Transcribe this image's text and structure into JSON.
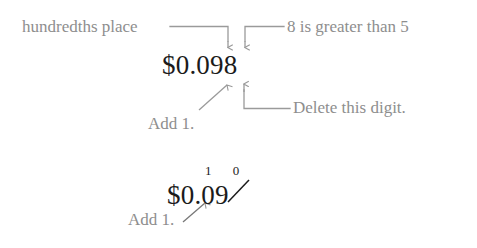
{
  "figure": {
    "background_color": "#ffffff",
    "label_color": "#8e8e8e",
    "number_color": "#1b1b1b",
    "line_color": "#9a9a9a"
  },
  "step_one": {
    "amount": "$0.098",
    "labels": {
      "hundredths_place": "hundredths place",
      "greater_than": "8 is greater than 5",
      "delete_digit": "Delete this digit.",
      "add_one": "Add 1."
    },
    "annotations": {
      "arrow_to_hundredths": "down-arrow-icon",
      "arrow_to_thousandths": "down-arrow-icon",
      "arrow_add_one": "up-right-arrow-icon",
      "arrow_delete": "up-arrow-icon"
    }
  },
  "step_two": {
    "amount_prefix": "$0.0",
    "struck_digit": "9",
    "carry_digits": "1 0",
    "carry_digit_left": "1",
    "carry_digit_right": "0",
    "labels": {
      "add_one": "Add 1."
    },
    "annotations": {
      "arrow_add_one": "up-right-arrow-icon",
      "strikethrough": "strikethrough-slash"
    }
  }
}
